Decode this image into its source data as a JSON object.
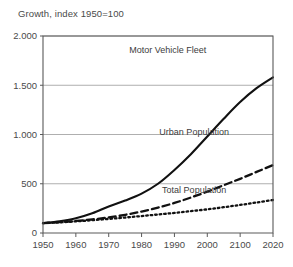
{
  "chart_data": {
    "type": "line",
    "title": "Growth, index 1950=100",
    "xlabel": "",
    "ylabel": "",
    "xlim": [
      1950,
      2020
    ],
    "ylim": [
      0,
      2000
    ],
    "grid": true,
    "legend_position": "inline-right",
    "x_tick_labels": [
      "1950",
      "1960",
      "1970",
      "1980",
      "1990",
      "2000",
      "2100",
      "2020"
    ],
    "x_ticks": [
      1950,
      1960,
      1970,
      1980,
      1990,
      2000,
      2010,
      2020
    ],
    "y_tick_labels": [
      "0",
      "500",
      "1.000",
      "1.500",
      "2.000"
    ],
    "y_ticks": [
      0,
      500,
      1000,
      1500,
      2000
    ],
    "x": [
      1950,
      1955,
      1960,
      1965,
      1970,
      1975,
      1980,
      1985,
      1990,
      1995,
      2000,
      2005,
      2010,
      2015,
      2020
    ],
    "series": [
      {
        "name": "Motor Vehicle Fleet",
        "style": "solid",
        "color": "#111111",
        "width": 2.1,
        "label_x": 1988,
        "label_y": 1830,
        "values": [
          100,
          120,
          150,
          200,
          270,
          330,
          400,
          500,
          640,
          800,
          980,
          1160,
          1330,
          1470,
          1580
        ]
      },
      {
        "name": "Urban Population",
        "style": "dashed",
        "color": "#111111",
        "width": 2.3,
        "label_x": 1996,
        "label_y": 1000,
        "values": [
          100,
          110,
          122,
          138,
          158,
          185,
          218,
          258,
          305,
          360,
          420,
          485,
          550,
          620,
          690
        ]
      },
      {
        "name": "Total Population",
        "style": "dotted",
        "color": "#111111",
        "width": 2.3,
        "label_x": 1996,
        "label_y": 410,
        "values": [
          100,
          108,
          118,
          130,
          143,
          157,
          172,
          188,
          204,
          222,
          240,
          262,
          285,
          310,
          335
        ]
      }
    ]
  },
  "plot_box": {
    "left": 43,
    "top": 36,
    "right": 273,
    "bottom": 233
  }
}
